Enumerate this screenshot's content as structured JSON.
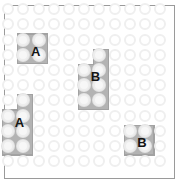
{
  "board": {
    "name": "peg-puzzle-board",
    "grid": {
      "columns": 11,
      "rows": 11
    },
    "cell_size": 15.2,
    "origin_x": 8.2,
    "origin_y": 9.2,
    "peg_diameter": 12,
    "colors": {
      "background": "#ffffff",
      "frame_border": "#9a9a9a",
      "empty_peg_outline": "#efefef",
      "piece_fill": "#b3b3b3",
      "piece_outline": "#a2a2a2",
      "filled_peg_fill": "#f7f7f7",
      "label_text": "#141414"
    }
  },
  "pieces": [
    {
      "id": "piece-a-top-left",
      "label": "A",
      "shape": "square-2x2",
      "cells": [
        [
          1,
          2
        ],
        [
          2,
          2
        ],
        [
          1,
          3
        ],
        [
          2,
          3
        ]
      ],
      "label_cell": [
        2,
        3
      ],
      "label_offset_x": -3,
      "label_offset_y": -4
    },
    {
      "id": "piece-b-middle",
      "label": "B",
      "shape": "p-pentomino",
      "cells": [
        [
          6,
          3
        ],
        [
          5,
          4
        ],
        [
          6,
          4
        ],
        [
          5,
          5
        ],
        [
          6,
          5
        ],
        [
          5,
          6
        ],
        [
          6,
          6
        ]
      ],
      "label_cell": [
        6,
        5
      ],
      "label_offset_x": -4,
      "label_offset_y": -9
    },
    {
      "id": "piece-a-bottom-left",
      "label": "A",
      "shape": "p-pentomino",
      "cells": [
        [
          1,
          6
        ],
        [
          0,
          7
        ],
        [
          1,
          7
        ],
        [
          0,
          8
        ],
        [
          1,
          8
        ],
        [
          0,
          9
        ],
        [
          1,
          9
        ]
      ],
      "label_cell": [
        1,
        8
      ],
      "label_offset_x": -4,
      "label_offset_y": -9
    },
    {
      "id": "piece-b-bottom-right",
      "label": "B",
      "shape": "square-2x2",
      "cells": [
        [
          8,
          8
        ],
        [
          9,
          8
        ],
        [
          8,
          9
        ],
        [
          9,
          9
        ]
      ],
      "label_cell": [
        9,
        9
      ],
      "label_offset_x": -3,
      "label_offset_y": -4
    }
  ]
}
